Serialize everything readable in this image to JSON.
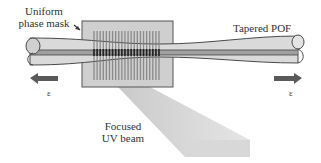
{
  "labels": {
    "mask_line1": "Uniform",
    "mask_line2": "phase mask",
    "fiber": "Tapered POF",
    "beam_line1": "Focused",
    "beam_line2": "UV beam",
    "strain_left": "ε",
    "strain_right": "ε"
  },
  "colors": {
    "fiber_fill": "#d9d9d9",
    "fiber_edge": "#4a4a4a",
    "mask_fill": "#c8c8c8",
    "mask_edge": "#555555",
    "grating": "#7a7a7a",
    "core": "#8a8a8a",
    "beam": "#d0d0d0",
    "arrow": "#5a5a5a"
  },
  "grating": {
    "lines": 22
  }
}
